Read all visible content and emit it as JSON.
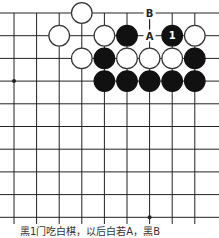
{
  "diagram": {
    "type": "go-board-fragment",
    "grid": {
      "columns": 9,
      "rows": 10,
      "origin_x": 14,
      "origin_y": 13,
      "spacing_x": 22.6,
      "spacing_y": 22.7,
      "line_color": "#222222",
      "board_color": "#ffffff",
      "top_edge": true,
      "extends_left": true,
      "extends_right": true,
      "extends_bottom": true
    },
    "star_points": [
      {
        "col": 0,
        "row": 3
      },
      {
        "col": 6,
        "row": 9
      }
    ],
    "stones": [
      {
        "color": "white",
        "col": 3,
        "row": 0
      },
      {
        "color": "white",
        "col": 2,
        "row": 1
      },
      {
        "color": "white",
        "col": 4,
        "row": 1
      },
      {
        "color": "black",
        "col": 5,
        "row": 1
      },
      {
        "color": "black",
        "col": 7,
        "row": 1,
        "label": "1"
      },
      {
        "color": "white",
        "col": 8,
        "row": 1
      },
      {
        "color": "white",
        "col": 3,
        "row": 2
      },
      {
        "color": "black",
        "col": 4,
        "row": 2
      },
      {
        "color": "white",
        "col": 5,
        "row": 2
      },
      {
        "color": "white",
        "col": 6,
        "row": 2
      },
      {
        "color": "white",
        "col": 7,
        "row": 2
      },
      {
        "color": "black",
        "col": 8,
        "row": 2
      },
      {
        "color": "black",
        "col": 4,
        "row": 3
      },
      {
        "color": "black",
        "col": 5,
        "row": 3
      },
      {
        "color": "black",
        "col": 6,
        "row": 3
      },
      {
        "color": "black",
        "col": 7,
        "row": 3
      },
      {
        "color": "black",
        "col": 8,
        "row": 3
      }
    ],
    "markers": [
      {
        "label": "B",
        "col": 6,
        "row": 0
      },
      {
        "label": "A",
        "col": 6,
        "row": 1
      }
    ],
    "colors": {
      "black_stone": "#111111",
      "white_stone": "#ffffff",
      "stone_outline": "#333333"
    }
  },
  "caption": "黑1门吃白棋，以后白若A，黑B"
}
